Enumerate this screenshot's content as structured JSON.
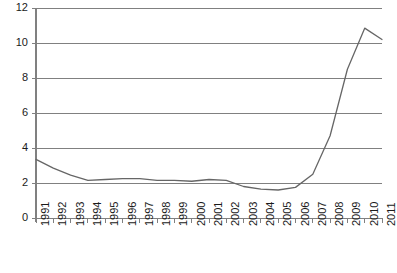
{
  "chart_data": {
    "type": "line",
    "title": "",
    "subtitle": "",
    "xlabel": "",
    "ylabel": "",
    "x": [
      1991,
      1992,
      1993,
      1994,
      1995,
      1996,
      1997,
      1998,
      1999,
      2000,
      2001,
      2002,
      2003,
      2004,
      2005,
      2006,
      2007,
      2008,
      2009,
      2010,
      2011
    ],
    "categories": [
      "1991",
      "1992",
      "1993",
      "1994",
      "1995",
      "1996",
      "1997",
      "1998",
      "1999",
      "2000",
      "2001",
      "2002",
      "2003",
      "2004",
      "2005",
      "2006",
      "2007",
      "2008",
      "2009",
      "2010",
      "2011"
    ],
    "values": [
      3.35,
      2.85,
      2.45,
      2.15,
      2.2,
      2.25,
      2.25,
      2.15,
      2.15,
      2.1,
      2.2,
      2.15,
      1.8,
      1.65,
      1.6,
      1.75,
      2.5,
      4.7,
      8.5,
      10.85,
      10.2
    ],
    "series": [
      {
        "name": "",
        "values": [
          3.35,
          2.85,
          2.45,
          2.15,
          2.2,
          2.25,
          2.25,
          2.15,
          2.15,
          2.1,
          2.2,
          2.15,
          1.8,
          1.65,
          1.6,
          1.75,
          2.5,
          4.7,
          8.5,
          10.85,
          10.2
        ],
        "color": "#666666"
      }
    ],
    "ylim": [
      0,
      12
    ],
    "yticks": [
      0,
      2,
      4,
      6,
      8,
      10,
      12
    ],
    "ytick_labels": [
      "0",
      "2",
      "4",
      "6",
      "8",
      "10",
      "12"
    ],
    "xtick_labels": [
      "1991",
      "1992",
      "1993",
      "1994",
      "1995",
      "1996",
      "1997",
      "1998",
      "1999",
      "2000",
      "2001",
      "2002",
      "2003",
      "2004",
      "2005",
      "2006",
      "2007",
      "2008",
      "2009",
      "2010",
      "2011"
    ],
    "grid": true,
    "grid_axis": "y",
    "legend": false,
    "legend_position": "none",
    "annotations": [],
    "colors": {
      "line": "#666666",
      "grid": "#808080",
      "axis": "#808080",
      "text": "#1a1a1a",
      "background": "#ffffff"
    },
    "x_labels_rotation": -90
  },
  "plot_geometry": {
    "left": 36,
    "right": 382,
    "top": 8,
    "bottom": 218
  }
}
